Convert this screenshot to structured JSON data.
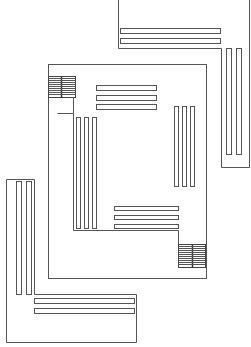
{
  "diagram": {
    "type": "architectural-floor-plan",
    "stroke_color": "#555555",
    "background": "#ffffff"
  },
  "elements": {
    "top_right_wing": {
      "outline": "L-shape",
      "horizontal_bars": 2,
      "vertical_bars": 2
    },
    "central_room": {
      "outline": "square",
      "top_bars": 3,
      "left_bars": 3,
      "right_bars": 3,
      "bottom_bars": 3,
      "staircases": 2
    },
    "bottom_left_wing": {
      "outline": "L-shape",
      "vertical_bars": 2,
      "horizontal_bars": 2
    }
  }
}
